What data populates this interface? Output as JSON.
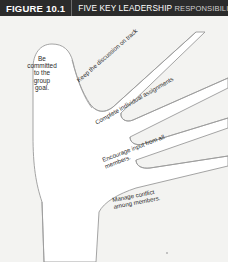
{
  "figure": {
    "number": "FIGURE 10.1",
    "title_lead": "FIVE KEY LEADERSHIP",
    "title_tail": "RESPONSIBILITIES",
    "header_bg": "#2b2b2b",
    "body_bg": "#f3f3f1",
    "hand_fill": "#ffffff",
    "outline_color": "#9a9a9a"
  },
  "diagram": {
    "type": "hand-outline",
    "thumb_label": "Be\ncommitted\nto the\ngroup\ngoal.",
    "finger_labels": [
      "Keep the discussion on track",
      "Complete individual assignments",
      "Encourage input from all\nmembers.",
      "Manage conflict\namong members."
    ]
  }
}
